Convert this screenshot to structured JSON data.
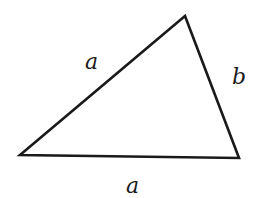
{
  "diagram": {
    "type": "triangle",
    "stroke_color": "#1a1a1a",
    "vertices": {
      "top": [
        185,
        16
      ],
      "left": [
        20,
        155
      ],
      "right": [
        239,
        158
      ]
    },
    "labels": {
      "left_side": "a",
      "right_side": "b",
      "bottom_side": "a"
    }
  }
}
